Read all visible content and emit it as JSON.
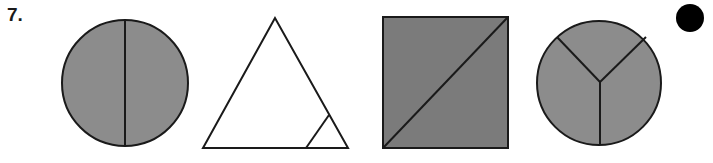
{
  "question": {
    "number_label": "7."
  },
  "colors": {
    "shaded_circle": "#8c8c8c",
    "shaded_square": "#7b7b7b",
    "outline": "#1a1a1a",
    "unshaded": "#ffffff",
    "marker_dot": "#000000"
  },
  "shapes": [
    {
      "id": "circle-halves",
      "type": "circle",
      "parts": 2,
      "shaded_parts": 2,
      "note": "circle divided by vertical line into two equal halves, fully shaded"
    },
    {
      "id": "triangle-corner",
      "type": "triangle",
      "parts": 2,
      "shaded_parts": 0,
      "note": "large triangle with small corner triangle cut at bottom-right, unshaded"
    },
    {
      "id": "square-diagonal",
      "type": "square",
      "parts": 2,
      "shaded_parts": 2,
      "note": "square divided by diagonal into two equal triangles, fully shaded"
    },
    {
      "id": "circle-thirds",
      "type": "circle",
      "parts": 3,
      "shaded_parts": 3,
      "note": "circle divided into three equal sectors (Y shape), fully shaded"
    }
  ],
  "marker": {
    "type": "filled-dot"
  }
}
